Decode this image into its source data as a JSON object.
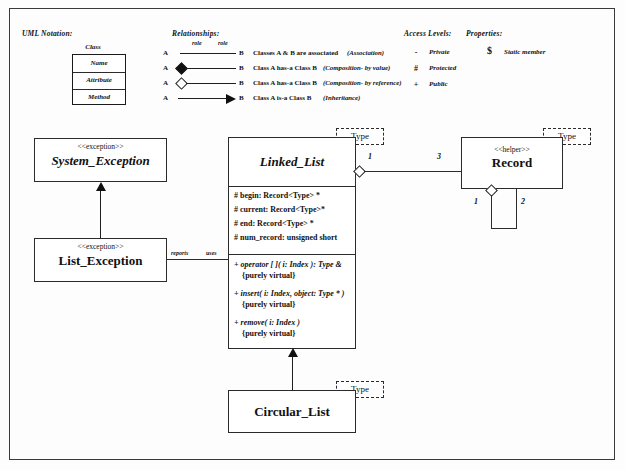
{
  "legend": {
    "uml_notation_title": "UML Notation:",
    "class_box": {
      "caption": "Class",
      "rows": [
        "Name",
        "Attribute",
        "Method"
      ]
    },
    "relationships_title": "Relationships:",
    "relationships": [
      {
        "from": "A",
        "to": "B",
        "role_left": "role",
        "role_right": "role",
        "description": "Classes A & B are associated",
        "kind": "(Association)",
        "marker": "plain-line"
      },
      {
        "from": "A",
        "to": "B",
        "description": "Class A  has-a  Class B",
        "kind": "(Composition- by value)",
        "marker": "filled-diamond"
      },
      {
        "from": "A",
        "to": "B",
        "description": "Class A  has-a  Class B",
        "kind": "(Composition- by reference)",
        "marker": "hollow-diamond"
      },
      {
        "from": "A",
        "to": "B",
        "description": "Class A  is-a  Class B",
        "kind": "(Inheritance)",
        "marker": "solid-arrow"
      }
    ],
    "access_levels_title": "Access Levels:",
    "access_levels": [
      {
        "symbol": "-",
        "label": "Private"
      },
      {
        "symbol": "#",
        "label": "Protected"
      },
      {
        "symbol": "+",
        "label": "Public"
      }
    ],
    "properties_title": "Properties:",
    "properties": [
      {
        "symbol": "$",
        "label": "Static member"
      }
    ]
  },
  "diagram": {
    "classes": {
      "system_exception": {
        "stereotype": "<<exception>>",
        "name": "System_Exception"
      },
      "list_exception": {
        "stereotype": "<<exception>>",
        "name": "List_Exception"
      },
      "linked_list": {
        "name": "Linked_List",
        "template": "Type",
        "attributes": [
          "# begin: Record<Type> *",
          "# current: Record<Type>*",
          "# end: Record<Type> *",
          "# num_record: unsigned short"
        ],
        "methods": [
          {
            "signature": "+ operator [ ]( i: Index ): Type &",
            "constraint": "{purely virtual}"
          },
          {
            "signature": "+ insert( i: Index, object: Type * )",
            "constraint": "{purely virtual}"
          },
          {
            "signature": "+ remove( i: Index )",
            "constraint": "{purely virtual}"
          }
        ]
      },
      "record": {
        "stereotype": "<<helper>>",
        "name": "Record",
        "template": "Type"
      },
      "circular_list": {
        "name": "Circular_List",
        "template": "Type"
      }
    },
    "association_labels": {
      "reports": "reports",
      "uses": "uses"
    },
    "multiplicities": {
      "linked_list_side": "1",
      "record_side": "3",
      "record_self_left": "1",
      "record_self_right": "2"
    }
  }
}
